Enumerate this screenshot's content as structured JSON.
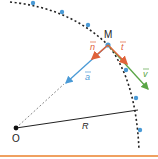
{
  "diagram": {
    "labels": {
      "point_m": "M",
      "center_o": "O",
      "radius": "R",
      "vector_n": "n",
      "vector_t": "t",
      "vector_v": "v",
      "vector_a": "a"
    },
    "colors": {
      "trajectory": "#222222",
      "points": "#4a9ad6",
      "n_vector": "#e0623a",
      "t_vector": "#e0623a",
      "v_vector": "#5aa546",
      "a_vector": "#4a9ad6",
      "radius_line": "#222222",
      "dashed_radius": "#888888",
      "bottom_rule": "#f0a060"
    },
    "trajectory_points": [
      [
        33,
        3
      ],
      [
        62,
        12
      ],
      [
        88,
        25
      ],
      [
        108,
        45
      ],
      [
        125,
        68
      ],
      [
        136,
        98
      ],
      [
        140,
        130
      ]
    ]
  }
}
